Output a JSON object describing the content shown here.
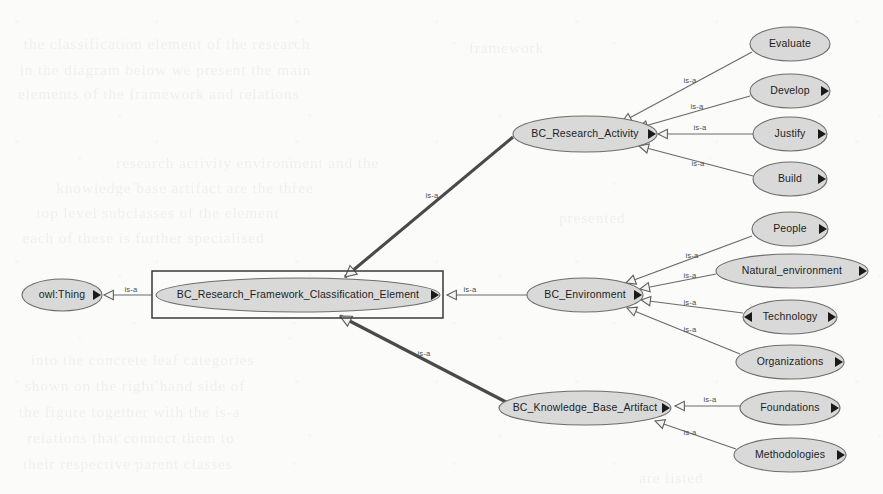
{
  "diagram": {
    "type": "class-hierarchy",
    "edge_relation_label": "is-a",
    "canvas": {
      "width": 883,
      "height": 494
    },
    "colors": {
      "background": "#fbfbfa",
      "node_fill": "#d9d9d9",
      "node_stroke": "#6d6d6d",
      "node_text": "#1d1d1d",
      "edge_thin": "#6a6a6a",
      "edge_thick": "#4a4a4a",
      "selection_stroke": "#3a3a3a",
      "marker_solid": "#1a1a1a"
    },
    "selection": {
      "node": "BC_Research_Framework_Classification_Element",
      "x": 152,
      "y": 271,
      "width": 291,
      "height": 47
    },
    "nodes": [
      {
        "id": "owl_thing",
        "label": "owl:Thing",
        "cx": 62,
        "cy": 295,
        "rx": 40,
        "ry": 16,
        "marker_right": true,
        "marker_left": false,
        "level": "root"
      },
      {
        "id": "root_elem",
        "label": "BC_Research_Framework_Classification_Element",
        "cx": 298,
        "cy": 295,
        "rx": 142,
        "ry": 17,
        "marker_right": true,
        "marker_left": false,
        "level": "center"
      },
      {
        "id": "activity",
        "label": "BC_Research_Activity",
        "cx": 585,
        "cy": 134,
        "rx": 72,
        "ry": 18,
        "marker_right": true,
        "marker_left": false,
        "level": "branch"
      },
      {
        "id": "environment",
        "label": "BC_Environment",
        "cx": 585,
        "cy": 295,
        "rx": 58,
        "ry": 17,
        "marker_right": true,
        "marker_left": false,
        "level": "branch"
      },
      {
        "id": "artifact",
        "label": "BC_Knowledge_Base_Artifact",
        "cx": 585,
        "cy": 408,
        "rx": 86,
        "ry": 17,
        "marker_right": true,
        "marker_left": false,
        "level": "branch"
      },
      {
        "id": "evaluate",
        "label": "Evaluate",
        "cx": 790,
        "cy": 44,
        "rx": 40,
        "ry": 17,
        "marker_right": false,
        "marker_left": false,
        "level": "leaf"
      },
      {
        "id": "develop",
        "label": "Develop",
        "cx": 790,
        "cy": 91,
        "rx": 40,
        "ry": 17,
        "marker_right": true,
        "marker_left": false,
        "level": "leaf"
      },
      {
        "id": "justify",
        "label": "Justify",
        "cx": 790,
        "cy": 134,
        "rx": 37,
        "ry": 17,
        "marker_right": true,
        "marker_left": false,
        "level": "leaf"
      },
      {
        "id": "build",
        "label": "Build",
        "cx": 790,
        "cy": 179,
        "rx": 37,
        "ry": 17,
        "marker_right": true,
        "marker_left": false,
        "level": "leaf"
      },
      {
        "id": "people",
        "label": "People",
        "cx": 790,
        "cy": 229,
        "rx": 38,
        "ry": 17,
        "marker_right": true,
        "marker_left": false,
        "level": "leaf"
      },
      {
        "id": "natural_env",
        "label": "Natural_environment",
        "cx": 792,
        "cy": 271,
        "rx": 76,
        "ry": 17,
        "marker_right": true,
        "marker_left": false,
        "level": "leaf"
      },
      {
        "id": "technology",
        "label": "Technology",
        "cx": 790,
        "cy": 317,
        "rx": 47,
        "ry": 17,
        "marker_right": true,
        "marker_left": true,
        "level": "leaf"
      },
      {
        "id": "organizations",
        "label": "Organizations",
        "cx": 790,
        "cy": 362,
        "rx": 54,
        "ry": 17,
        "marker_right": true,
        "marker_left": false,
        "level": "leaf"
      },
      {
        "id": "foundations",
        "label": "Foundations",
        "cx": 790,
        "cy": 408,
        "rx": 50,
        "ry": 17,
        "marker_right": true,
        "marker_left": false,
        "level": "leaf"
      },
      {
        "id": "methodologies",
        "label": "Methodologies",
        "cx": 790,
        "cy": 455,
        "rx": 56,
        "ry": 17,
        "marker_right": true,
        "marker_left": false,
        "level": "leaf"
      }
    ],
    "edges": [
      {
        "from": "root_elem",
        "to": "owl_thing",
        "label": "is-a",
        "weight": "thin",
        "x1": 152,
        "y1": 295,
        "x2": 108,
        "y2": 295,
        "lx": 131,
        "ly": 290,
        "ax": 104,
        "ay": 295,
        "adir": "left"
      },
      {
        "from": "activity",
        "to": "root_elem",
        "label": "is-a",
        "weight": "thick",
        "x1": 513,
        "y1": 137,
        "x2": 345,
        "y2": 277,
        "lx": 432,
        "ly": 196,
        "ax": 345,
        "ay": 277,
        "adir": "downleft"
      },
      {
        "from": "environment",
        "to": "root_elem",
        "label": "is-a",
        "weight": "thin",
        "x1": 527,
        "y1": 295,
        "x2": 447,
        "y2": 295,
        "lx": 470,
        "ly": 290,
        "ax": 447,
        "ay": 295,
        "adir": "left"
      },
      {
        "from": "artifact",
        "to": "root_elem",
        "label": "is-a",
        "weight": "thick",
        "x1": 506,
        "y1": 402,
        "x2": 340,
        "y2": 316,
        "lx": 424,
        "ly": 354,
        "ax": 340,
        "ay": 316,
        "adir": "upleft"
      },
      {
        "from": "evaluate",
        "to": "activity",
        "label": "is-a",
        "weight": "thin",
        "x1": 752,
        "y1": 52,
        "x2": 622,
        "y2": 122,
        "lx": 690,
        "ly": 81,
        "ax": 622,
        "ay": 122,
        "adir": "downleft"
      },
      {
        "from": "develop",
        "to": "activity",
        "label": "is-a",
        "weight": "thin",
        "x1": 750,
        "y1": 96,
        "x2": 638,
        "y2": 128,
        "lx": 697,
        "ly": 107,
        "ax": 638,
        "ay": 128,
        "adir": "downleft"
      },
      {
        "from": "justify",
        "to": "activity",
        "label": "is-a",
        "weight": "thin",
        "x1": 753,
        "y1": 134,
        "x2": 660,
        "y2": 134,
        "lx": 700,
        "ly": 128,
        "ax": 658,
        "ay": 134,
        "adir": "left"
      },
      {
        "from": "build",
        "to": "activity",
        "label": "is-a",
        "weight": "thin",
        "x1": 753,
        "y1": 176,
        "x2": 639,
        "y2": 146,
        "lx": 698,
        "ly": 164,
        "ax": 639,
        "ay": 146,
        "adir": "upleft"
      },
      {
        "from": "people",
        "to": "environment",
        "label": "is-a",
        "weight": "thin",
        "x1": 752,
        "y1": 236,
        "x2": 626,
        "y2": 283,
        "lx": 692,
        "ly": 256,
        "ax": 626,
        "ay": 283,
        "adir": "downleft"
      },
      {
        "from": "natural_env",
        "to": "environment",
        "label": "is-a",
        "weight": "thin",
        "x1": 716,
        "y1": 274,
        "x2": 640,
        "y2": 289,
        "lx": 690,
        "ly": 276,
        "ax": 640,
        "ay": 289,
        "adir": "downleft"
      },
      {
        "from": "technology",
        "to": "environment",
        "label": "is-a",
        "weight": "thin",
        "x1": 743,
        "y1": 313,
        "x2": 641,
        "y2": 300,
        "lx": 690,
        "ly": 303,
        "ax": 641,
        "ay": 300,
        "adir": "upleft"
      },
      {
        "from": "organizations",
        "to": "environment",
        "label": "is-a",
        "weight": "thin",
        "x1": 740,
        "y1": 354,
        "x2": 627,
        "y2": 308,
        "lx": 690,
        "ly": 330,
        "ax": 627,
        "ay": 308,
        "adir": "upleft"
      },
      {
        "from": "foundations",
        "to": "artifact",
        "label": "is-a",
        "weight": "thin",
        "x1": 740,
        "y1": 406,
        "x2": 677,
        "y2": 406,
        "lx": 710,
        "ly": 400,
        "ax": 675,
        "ay": 406,
        "adir": "left"
      },
      {
        "from": "methodologies",
        "to": "artifact",
        "label": "is-a",
        "weight": "thin",
        "x1": 736,
        "y1": 449,
        "x2": 655,
        "y2": 421,
        "lx": 690,
        "ly": 433,
        "ax": 655,
        "ay": 421,
        "adir": "upleft"
      }
    ],
    "background_ghost_text": {
      "description": "faint illegible show-through text from the reverse side of the scanned page",
      "lines": [
        {
          "text": "the classification element of the research",
          "x": 28,
          "y": 36,
          "size": 15
        },
        {
          "text": "in the diagram below we present the main",
          "x": 24,
          "y": 62,
          "size": 15
        },
        {
          "text": "elements of the framework and relations",
          "x": 22,
          "y": 86,
          "size": 15
        },
        {
          "text": "research activity environment and the",
          "x": 120,
          "y": 155,
          "size": 15
        },
        {
          "text": "knowledge base artifact are the three",
          "x": 60,
          "y": 180,
          "size": 15
        },
        {
          "text": "top level subclasses of the element",
          "x": 40,
          "y": 205,
          "size": 15
        },
        {
          "text": "each of these is further specialised",
          "x": 26,
          "y": 230,
          "size": 15
        },
        {
          "text": "into the concrete leaf categories",
          "x": 34,
          "y": 352,
          "size": 15
        },
        {
          "text": "shown on the right hand side of",
          "x": 28,
          "y": 378,
          "size": 15
        },
        {
          "text": "the figure together with the is-a",
          "x": 22,
          "y": 404,
          "size": 15
        },
        {
          "text": "relations that connect them to",
          "x": 30,
          "y": 430,
          "size": 15
        },
        {
          "text": "their respective parent classes",
          "x": 26,
          "y": 456,
          "size": 15
        },
        {
          "text": "framework",
          "x": 470,
          "y": 40,
          "size": 15
        },
        {
          "text": "presented",
          "x": 560,
          "y": 210,
          "size": 15
        },
        {
          "text": "are listed",
          "x": 640,
          "y": 470,
          "size": 15
        }
      ]
    }
  }
}
